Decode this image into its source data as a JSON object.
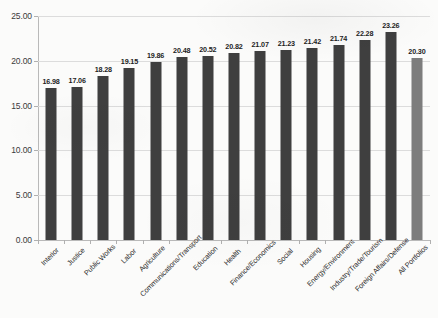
{
  "chart_data": {
    "type": "bar",
    "title": "",
    "subtitle": "",
    "xlabel": "",
    "ylabel": "",
    "ylim": [
      0,
      25
    ],
    "ytick_step": 5,
    "ytick_labels": [
      "0.00",
      "5.00",
      "10.00",
      "15.00",
      "20.00",
      "25.00"
    ],
    "ytick_values": [
      0,
      5,
      10,
      15,
      20,
      25
    ],
    "grid": true,
    "legend": "none",
    "categories": [
      "Interior",
      "Justice",
      "Public Works",
      "Labor",
      "Agriculture",
      "Communications/Transport",
      "Education",
      "Health",
      "Finance/Economics",
      "Social",
      "Housing",
      "Energy/Environment",
      "Industry/Trade/Tourism",
      "Foreign Affairs/Defense",
      "All Portfolios"
    ],
    "values": [
      16.98,
      17.06,
      18.28,
      19.15,
      19.86,
      20.48,
      20.52,
      20.82,
      21.07,
      21.23,
      21.42,
      21.74,
      22.28,
      23.26,
      20.3
    ],
    "value_labels": [
      "16.98",
      "17.06",
      "18.28",
      "19.15",
      "19.86",
      "20.48",
      "20.52",
      "20.82",
      "21.07",
      "21.23",
      "21.42",
      "21.74",
      "22.28",
      "23.26",
      "20.30"
    ],
    "bar_colors": [
      "#3f3f3f",
      "#3f3f3f",
      "#3f3f3f",
      "#3f3f3f",
      "#3f3f3f",
      "#3f3f3f",
      "#3f3f3f",
      "#3f3f3f",
      "#3f3f3f",
      "#3f3f3f",
      "#3f3f3f",
      "#3f3f3f",
      "#3f3f3f",
      "#3f3f3f",
      "#7d7d7d"
    ],
    "colors": {
      "bar_primary": "#3f3f3f",
      "bar_total": "#7d7d7d",
      "gridline": "#dcdcdc",
      "axis": "#b9b9b9",
      "background": "#fbfbfa",
      "text": "#2b2b2b"
    }
  }
}
